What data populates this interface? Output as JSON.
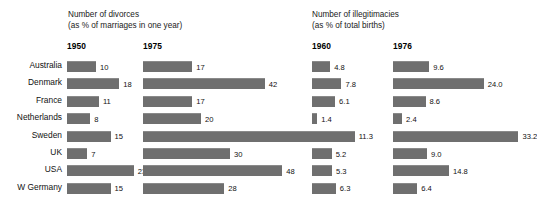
{
  "chart_data": {
    "type": "bar",
    "title": "",
    "orientation": "horizontal",
    "categories": [
      "Australia",
      "Denmark",
      "France",
      "Netherlands",
      "Sweden",
      "UK",
      "USA",
      "W Germany"
    ],
    "panels": [
      {
        "name": "divorces",
        "title_line1": "Number of divorces",
        "title_line2": "(as % of marriages in one year)",
        "ylabel": "",
        "xlabel": "% of marriages in one year",
        "series": [
          {
            "name": "1950",
            "values": [
              10,
              18,
              11,
              8,
              15,
              7,
              23,
              15
            ]
          },
          {
            "name": "1975",
            "values": [
              17,
              42,
              17,
              20,
              59,
              30,
              48,
              28
            ]
          }
        ]
      },
      {
        "name": "illegitimacies",
        "title_line1": "Number of illegitimacies",
        "title_line2": "(as % of total births)",
        "ylabel": "",
        "xlabel": "% of total births",
        "series": [
          {
            "name": "1960",
            "values": [
              4.8,
              7.8,
              6.1,
              1.4,
              11.3,
              5.2,
              5.3,
              6.3
            ]
          },
          {
            "name": "1976",
            "values": [
              9.6,
              24.0,
              8.6,
              2.4,
              33.2,
              9.0,
              14.8,
              6.4
            ]
          }
        ]
      }
    ],
    "value_labels": {
      "divorces_1950": [
        "10",
        "18",
        "11",
        "8",
        "15",
        "7",
        "23",
        "15"
      ],
      "divorces_1975": [
        "17",
        "42",
        "17",
        "20",
        "59",
        "30",
        "48",
        "28"
      ],
      "illegitimacies_1960": [
        "4.8",
        "7.8",
        "6.1",
        "1.4",
        "11.3",
        "5.2",
        "5.3",
        "6.3"
      ],
      "illegitimacies_1976": [
        "9.6",
        "24.0",
        "8.6",
        "2.4",
        "33.2",
        "9.0",
        "14.8",
        "6.4"
      ]
    },
    "grid": false,
    "legend": "none",
    "bar_color": "#6f6f6f",
    "background_color": "#ffffff",
    "text_color": "#111111"
  },
  "layout": {
    "label_column_right": 62,
    "row_top": 61,
    "row_height": 17.4,
    "bar_height": 11,
    "panels": [
      {
        "series_starts": [
          67,
          143
        ],
        "unit_px": 2.9
      },
      {
        "series_starts": [
          312,
          393
        ],
        "unit_px": 3.78
      }
    ],
    "title_positions": [
      {
        "left": 68,
        "top": 10
      },
      {
        "left": 312,
        "top": 10
      }
    ],
    "year_positions": [
      {
        "left": 67,
        "top": 41
      },
      {
        "left": 143,
        "top": 41
      },
      {
        "left": 312,
        "top": 41
      },
      {
        "left": 393,
        "top": 41
      }
    ]
  }
}
